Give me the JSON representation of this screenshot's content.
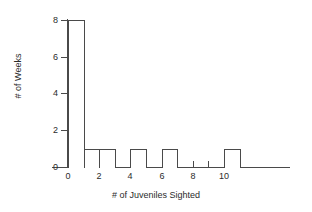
{
  "chart_data": {
    "type": "bar",
    "title": "",
    "subtitle": "",
    "xlabel": "# of Juveniles Sighted",
    "ylabel": "# of Weeks",
    "categories": [
      "0-1",
      "1-2",
      "2-3",
      "3-4",
      "4-5",
      "5-6",
      "6-7",
      "7-8",
      "8-9",
      "9-10",
      "10-11"
    ],
    "bin_starts": [
      0,
      1,
      2,
      3,
      4,
      5,
      6,
      7,
      8,
      9,
      10
    ],
    "bin_width": 1,
    "values": [
      8,
      1,
      1,
      0,
      1,
      0,
      1,
      0,
      0,
      0,
      1
    ],
    "xlim": [
      0,
      11
    ],
    "ylim": [
      0,
      8
    ],
    "x_ticks": [
      0,
      1,
      2,
      3,
      4,
      5,
      6,
      7,
      8,
      9,
      10,
      11
    ],
    "x_tick_labels": [
      "0",
      "",
      "2",
      "",
      "4",
      "",
      "6",
      "",
      "8",
      "",
      "10",
      ""
    ],
    "y_ticks": [
      0,
      2,
      4,
      6,
      8
    ],
    "y_tick_labels": [
      "0",
      "2",
      "4",
      "6",
      "8"
    ],
    "grid": false,
    "legend": false,
    "legend_position": "none",
    "bar_fill": "#ffffff",
    "bar_edge_color": "#4a4a4a",
    "axis_color": "#4a4a4a",
    "background": "#ffffff",
    "annotations": []
  }
}
